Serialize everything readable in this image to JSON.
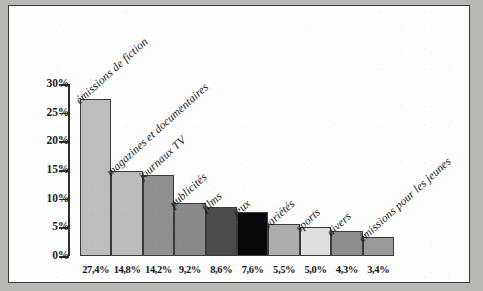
{
  "chart_data": {
    "type": "bar",
    "title": "",
    "xlabel": "",
    "ylabel": "",
    "ylim": [
      0,
      30
    ],
    "grid": false,
    "legend": "none",
    "categories": [
      "émissions de fiction",
      "magazines et documentaires",
      "journaux TV",
      "publicités",
      "films",
      "jeux",
      "variétés",
      "sports",
      "divers",
      "émissions pour les jeunes"
    ],
    "values": [
      27.4,
      14.8,
      14.2,
      9.2,
      8.6,
      7.6,
      5.5,
      5.0,
      4.3,
      3.4
    ],
    "value_labels": [
      "27,4%",
      "14,8%",
      "14,2%",
      "9,2%",
      "8,6%",
      "7,6%",
      "5,5%",
      "5,0%",
      "4,3%",
      "3,4%"
    ],
    "bar_colors": [
      "#bdbdbd",
      "#bcbcbc",
      "#8f8f8f",
      "#8a8a8a",
      "#4c4c4c",
      "#080808",
      "#adadad",
      "#dedede",
      "#8d8d8d",
      "#9a9a9a"
    ],
    "y_ticks": [
      {
        "value": 30,
        "label": "30%"
      },
      {
        "value": 25,
        "label": "25%"
      },
      {
        "value": 20,
        "label": "20%"
      },
      {
        "value": 15,
        "label": "15%"
      },
      {
        "value": 10,
        "label": "10%"
      },
      {
        "value": 5,
        "label": "5%"
      },
      {
        "value": 0,
        "label": "0%"
      }
    ]
  },
  "colors": {
    "page_background": "#b7b7b3",
    "paper": "#fdfdfd",
    "frame_border": "#3a3a3a",
    "axis": "#2e2e2e",
    "text": "#15151a"
  }
}
